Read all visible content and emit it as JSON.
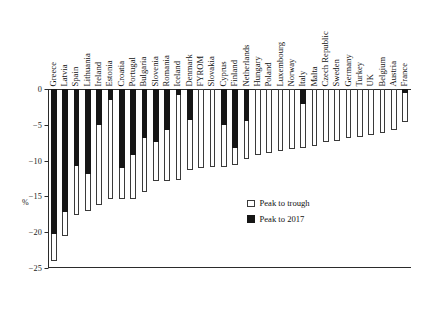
{
  "chart_data": {
    "type": "bar",
    "title": "",
    "xlabel": "",
    "ylabel": "%",
    "ylim": [
      -25,
      0
    ],
    "yticks": [
      0,
      -5,
      -10,
      -15,
      -20,
      -25
    ],
    "ytick_labels": [
      "0",
      "−5",
      "−10",
      "−15",
      "−20",
      "−25"
    ],
    "grid": false,
    "legend_position": "center-right",
    "orientation": "vertical",
    "categories": [
      "Greece",
      "Latvia",
      "Spain",
      "Lithuania",
      "Ireland",
      "Estonia",
      "Croatia",
      "Portugal",
      "Bulgaria",
      "Slovenia",
      "Romania",
      "Iceland",
      "Denmark",
      "FYROM",
      "Slovakia",
      "Cyprus",
      "Finland",
      "Netherlands",
      "Hungary",
      "Poland",
      "Luxembourg",
      "Norway",
      "Italy",
      "Malta",
      "Czech Republic",
      "Sweden",
      "Germany",
      "Turkey",
      "UK",
      "Belgium",
      "Austria",
      "France"
    ],
    "series": [
      {
        "name": "Peak to trough",
        "color": "#ffffff",
        "values": [
          -24.0,
          -20.6,
          -17.6,
          -17.1,
          -16.2,
          -15.4,
          -15.3,
          -15.3,
          -14.4,
          -12.9,
          -12.9,
          -12.7,
          -11.3,
          -11.1,
          -10.9,
          -10.9,
          -10.6,
          -9.8,
          -9.2,
          -8.9,
          -8.6,
          -8.4,
          -8.2,
          -7.9,
          -7.4,
          -7.2,
          -6.9,
          -6.7,
          -6.4,
          -6.1,
          -5.7,
          -4.6
        ]
      },
      {
        "name": "Peak to 2017",
        "color": "#161616",
        "values": [
          -20.2,
          -17.2,
          -10.8,
          -11.9,
          -5.0,
          -1.6,
          -11.0,
          -9.2,
          -6.9,
          -7.4,
          -5.7,
          -0.8,
          -4.3,
          0.0,
          0.0,
          -5.0,
          -8.3,
          -4.4,
          0.0,
          0.0,
          0.0,
          0.0,
          -2.1,
          0.0,
          0.0,
          0.0,
          0.0,
          0.0,
          0.0,
          0.0,
          0.0,
          -0.6
        ]
      }
    ]
  },
  "legend": {
    "items": [
      {
        "label": "Peak to trough",
        "swatch": "white"
      },
      {
        "label": "Peak to 2017",
        "swatch": "black"
      }
    ]
  }
}
